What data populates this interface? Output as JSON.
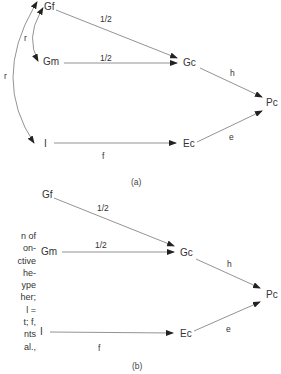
{
  "figure_a": {
    "nodes": {
      "gf": "Gf",
      "gm": "Gm",
      "gc": "Gc",
      "pc": "Pc",
      "i": "I",
      "ec": "Ec"
    },
    "edges": {
      "gf_gc": "1/2",
      "gm_gc": "1/2",
      "gc_pc": "h",
      "ec_pc": "e",
      "i_ec": "f",
      "gf_gm": "r",
      "gf_i": "r"
    },
    "caption": "(a)"
  },
  "figure_b": {
    "nodes": {
      "gf": "Gf",
      "gm": "Gm",
      "gc": "Gc",
      "pc": "Pc",
      "i": "I",
      "ec": "Ec"
    },
    "edges": {
      "gf_gc": "1/2",
      "gm_gc": "1/2",
      "gc_pc": "h",
      "ec_pc": "e",
      "i_ec": "f"
    },
    "caption": "(b)"
  },
  "side_text": {
    "lines": [
      "n of",
      "on-",
      "ctive",
      "he-",
      "ype",
      "her;",
      "l =",
      "t; f,",
      "nts",
      "al.,"
    ]
  }
}
